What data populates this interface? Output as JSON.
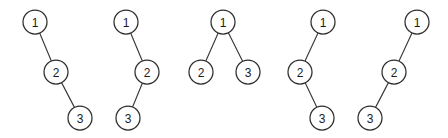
{
  "figure": {
    "background_color": "#ffffff",
    "node_fill": "#ffffff",
    "node_stroke": "#2e2e2e",
    "edge_stroke": "#3a3a3a",
    "node_radius": 12,
    "width": 448,
    "height": 138
  },
  "chart_data": {
    "type": "diagram",
    "subtitle": "",
    "xlabel": "",
    "ylabel": "",
    "grid": false,
    "legend": "none",
    "count": 5,
    "trees": [
      {
        "index": 1,
        "shape": "right-right chain",
        "root": "1",
        "nodes": [
          {
            "label": "1",
            "x": 35,
            "y": 22
          },
          {
            "label": "2",
            "x": 56,
            "y": 72
          },
          {
            "label": "3",
            "x": 80,
            "y": 118
          }
        ],
        "edges": [
          {
            "from": "1",
            "to": "2",
            "direction": "right"
          },
          {
            "from": "2",
            "to": "3",
            "direction": "right"
          }
        ]
      },
      {
        "index": 2,
        "shape": "right-left zigzag",
        "root": "1",
        "nodes": [
          {
            "label": "1",
            "x": 126,
            "y": 22
          },
          {
            "label": "2",
            "x": 147,
            "y": 72
          },
          {
            "label": "3",
            "x": 128,
            "y": 118
          }
        ],
        "edges": [
          {
            "from": "1",
            "to": "2",
            "direction": "right"
          },
          {
            "from": "2",
            "to": "3",
            "direction": "left"
          }
        ]
      },
      {
        "index": 3,
        "shape": "balanced",
        "root": "1",
        "nodes": [
          {
            "label": "1",
            "x": 223,
            "y": 22
          },
          {
            "label": "2",
            "x": 201,
            "y": 72
          },
          {
            "label": "3",
            "x": 248,
            "y": 72
          }
        ],
        "edges": [
          {
            "from": "1",
            "to": "2",
            "direction": "left"
          },
          {
            "from": "1",
            "to": "3",
            "direction": "right"
          }
        ]
      },
      {
        "index": 4,
        "shape": "left-right zigzag",
        "root": "1",
        "nodes": [
          {
            "label": "1",
            "x": 323,
            "y": 22
          },
          {
            "label": "2",
            "x": 300,
            "y": 72
          },
          {
            "label": "3",
            "x": 322,
            "y": 118
          }
        ],
        "edges": [
          {
            "from": "1",
            "to": "2",
            "direction": "left"
          },
          {
            "from": "2",
            "to": "3",
            "direction": "right"
          }
        ]
      },
      {
        "index": 5,
        "shape": "left-left chain",
        "root": "1",
        "nodes": [
          {
            "label": "1",
            "x": 417,
            "y": 22
          },
          {
            "label": "2",
            "x": 394,
            "y": 72
          },
          {
            "label": "3",
            "x": 370,
            "y": 118
          }
        ],
        "edges": [
          {
            "from": "1",
            "to": "2",
            "direction": "left"
          },
          {
            "from": "2",
            "to": "3",
            "direction": "left"
          }
        ]
      }
    ]
  }
}
